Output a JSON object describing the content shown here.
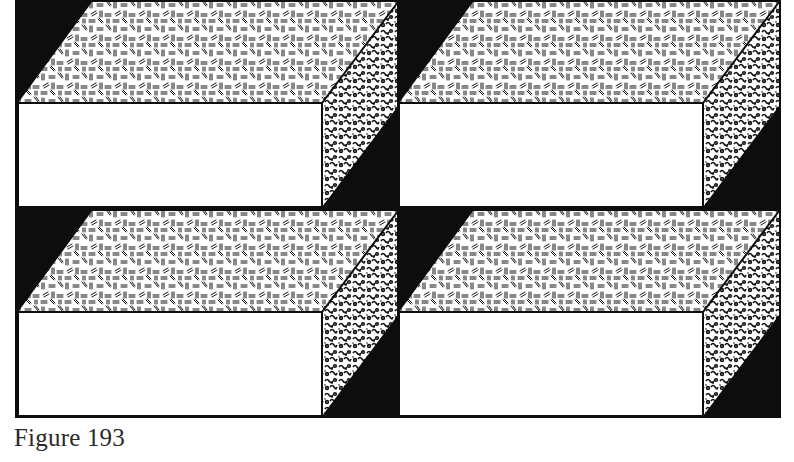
{
  "figure": {
    "caption": "Figure 193",
    "grid": {
      "rows": 2,
      "cols": 2
    },
    "colors": {
      "ink": "#0d0d0d",
      "paper": "#ffffff",
      "caption_text": "#2a2a2a"
    },
    "tiles": [
      {
        "id": "tile-top-left",
        "row": 0,
        "col": 0
      },
      {
        "id": "tile-top-right",
        "row": 0,
        "col": 1
      },
      {
        "id": "tile-bottom-left",
        "row": 1,
        "col": 0
      },
      {
        "id": "tile-bottom-right",
        "row": 1,
        "col": 1
      }
    ]
  }
}
